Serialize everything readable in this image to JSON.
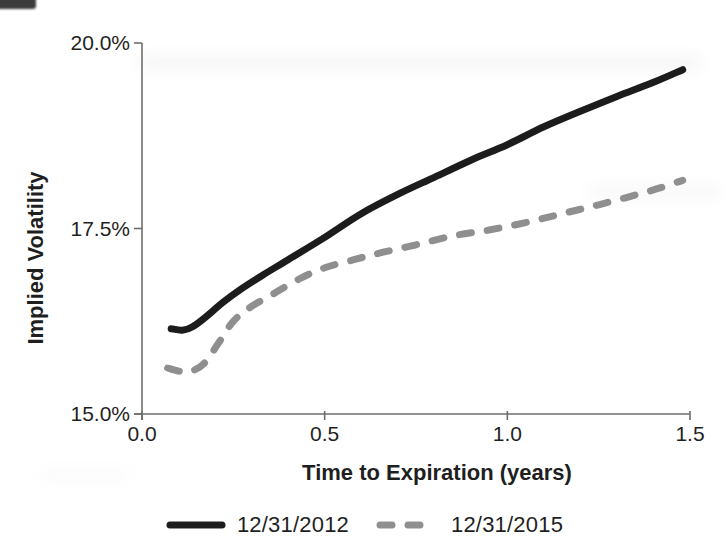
{
  "chart_data": {
    "type": "line",
    "title": "",
    "xlabel": "Time to Expiration (years)",
    "ylabel": "Implied Volatility",
    "xlim": [
      0.0,
      1.5
    ],
    "ylim": [
      15.0,
      20.0
    ],
    "grid": false,
    "legend_position": "bottom",
    "axis_color": "#6e6e6e",
    "text_color": "#1f1f1f",
    "x_ticks": [
      {
        "value": 0.0,
        "label": "0.0"
      },
      {
        "value": 0.5,
        "label": "0.5"
      },
      {
        "value": 1.0,
        "label": "1.0"
      },
      {
        "value": 1.5,
        "label": "1.5"
      }
    ],
    "y_ticks": [
      {
        "value": 15.0,
        "label": "15.0%"
      },
      {
        "value": 17.5,
        "label": "17.5%"
      },
      {
        "value": 20.0,
        "label": "20.0%"
      }
    ],
    "series": [
      {
        "name": "12/31/2012",
        "style": "solid",
        "color": "#1c1c1c",
        "width": 7,
        "points": [
          [
            0.08,
            16.15
          ],
          [
            0.11,
            16.13
          ],
          [
            0.14,
            16.18
          ],
          [
            0.18,
            16.33
          ],
          [
            0.22,
            16.5
          ],
          [
            0.27,
            16.68
          ],
          [
            0.33,
            16.87
          ],
          [
            0.4,
            17.08
          ],
          [
            0.5,
            17.38
          ],
          [
            0.6,
            17.7
          ],
          [
            0.7,
            17.96
          ],
          [
            0.8,
            18.19
          ],
          [
            0.9,
            18.42
          ],
          [
            1.0,
            18.63
          ],
          [
            1.1,
            18.87
          ],
          [
            1.2,
            19.08
          ],
          [
            1.3,
            19.28
          ],
          [
            1.4,
            19.47
          ],
          [
            1.48,
            19.64
          ]
        ]
      },
      {
        "name": "12/31/2015",
        "style": "dashed",
        "color": "#8f8f8f",
        "width": 7,
        "points": [
          [
            0.07,
            15.62
          ],
          [
            0.1,
            15.58
          ],
          [
            0.13,
            15.57
          ],
          [
            0.17,
            15.68
          ],
          [
            0.21,
            15.96
          ],
          [
            0.25,
            16.25
          ],
          [
            0.3,
            16.45
          ],
          [
            0.36,
            16.62
          ],
          [
            0.43,
            16.82
          ],
          [
            0.5,
            16.97
          ],
          [
            0.58,
            17.08
          ],
          [
            0.66,
            17.18
          ],
          [
            0.75,
            17.28
          ],
          [
            0.85,
            17.4
          ],
          [
            0.95,
            17.48
          ],
          [
            1.05,
            17.58
          ],
          [
            1.15,
            17.7
          ],
          [
            1.25,
            17.82
          ],
          [
            1.35,
            17.95
          ],
          [
            1.42,
            18.05
          ],
          [
            1.48,
            18.15
          ]
        ]
      }
    ]
  }
}
